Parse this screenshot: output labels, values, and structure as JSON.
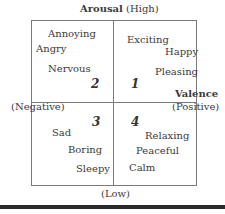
{
  "axes": {
    "arousal_label": "Arousal",
    "arousal_high": "(High)",
    "arousal_low": "(Low)",
    "valence_label": "Valence",
    "valence_positive": "(Positive)",
    "valence_negative": "(Negative)"
  },
  "quadrants": [
    {
      "number": "1",
      "words": [
        "Exciting",
        "Happy",
        "Pleasing"
      ]
    },
    {
      "number": "2",
      "words": [
        "Annoying",
        "Angry",
        "Nervous"
      ]
    },
    {
      "number": "3",
      "words": [
        "Sad",
        "Boring",
        "Sleepy"
      ]
    },
    {
      "number": "4",
      "words": [
        "Relaxing",
        "Peaceful",
        "Calm"
      ]
    }
  ]
}
